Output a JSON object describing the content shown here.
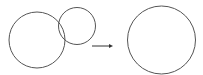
{
  "diagram": {
    "stroke_color": "#555555",
    "background": "#ffffff",
    "before": {
      "large_circle": {
        "cx": 37,
        "cy": 40,
        "r": 28
      },
      "small_circle": {
        "cx": 77,
        "cy": 26,
        "r": 18.5
      }
    },
    "arrow": {
      "x1": 92,
      "y1": 46,
      "x2": 113,
      "y2": 46,
      "direction": "right"
    },
    "after": {
      "merged_circle": {
        "cx": 161.5,
        "cy": 40,
        "r": 34
      }
    }
  }
}
